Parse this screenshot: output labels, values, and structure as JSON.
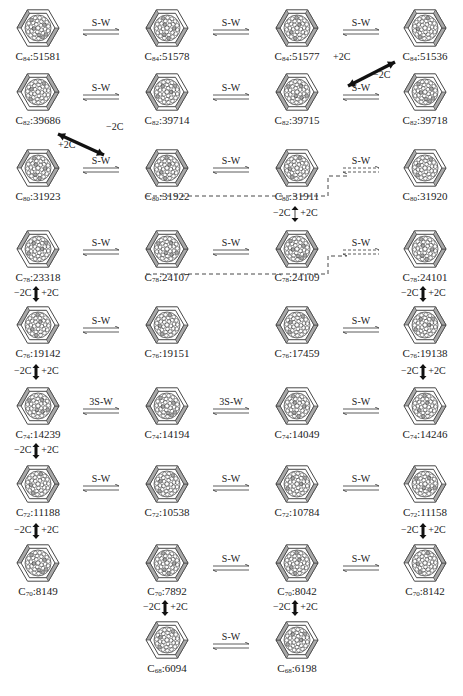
{
  "colors": {
    "line": "#333333",
    "shade": "#a8a8a8",
    "arrow": "#111111"
  },
  "columns_x": [
    38,
    167,
    297,
    425
  ],
  "nodes": [
    {
      "id": "c84-51581",
      "n": "84",
      "num": "51581",
      "col": 0,
      "y": 8
    },
    {
      "id": "c84-51578",
      "n": "84",
      "num": "51578",
      "col": 1,
      "y": 8
    },
    {
      "id": "c84-51577",
      "n": "84",
      "num": "51577",
      "col": 2,
      "y": 8
    },
    {
      "id": "c84-51536",
      "n": "84",
      "num": "51536",
      "col": 3,
      "y": 8
    },
    {
      "id": "c82-39686",
      "n": "82",
      "num": "39686",
      "col": 0,
      "y": 72
    },
    {
      "id": "c82-39714",
      "n": "82",
      "num": "39714",
      "col": 1,
      "y": 72
    },
    {
      "id": "c82-39715",
      "n": "82",
      "num": "39715",
      "col": 2,
      "y": 72
    },
    {
      "id": "c82-39718",
      "n": "82",
      "num": "39718",
      "col": 3,
      "y": 72
    },
    {
      "id": "c80-31923",
      "n": "80",
      "num": "31923",
      "col": 0,
      "y": 148
    },
    {
      "id": "c80-31922",
      "n": "80",
      "num": "31922",
      "col": 1,
      "y": 148
    },
    {
      "id": "c80-31911",
      "n": "80",
      "num": "31911",
      "col": 2,
      "y": 148
    },
    {
      "id": "c80-31920",
      "n": "80",
      "num": "31920",
      "col": 3,
      "y": 148
    },
    {
      "id": "c78-23318",
      "n": "78",
      "num": "23318",
      "col": 0,
      "y": 229
    },
    {
      "id": "c78-24107",
      "n": "78",
      "num": "24107",
      "col": 1,
      "y": 229
    },
    {
      "id": "c78-24109",
      "n": "78",
      "num": "24109",
      "col": 2,
      "y": 229
    },
    {
      "id": "c78-24101",
      "n": "78",
      "num": "24101",
      "col": 3,
      "y": 229
    },
    {
      "id": "c76-19142",
      "n": "76",
      "num": "19142",
      "col": 0,
      "y": 305
    },
    {
      "id": "c76-19151",
      "n": "76",
      "num": "19151",
      "col": 1,
      "y": 305
    },
    {
      "id": "c76-17459",
      "n": "76",
      "num": "17459",
      "col": 2,
      "y": 305
    },
    {
      "id": "c76-19138",
      "n": "76",
      "num": "19138",
      "col": 3,
      "y": 305
    },
    {
      "id": "c74-14239",
      "n": "74",
      "num": "14239",
      "col": 0,
      "y": 386
    },
    {
      "id": "c74-14194",
      "n": "74",
      "num": "14194",
      "col": 1,
      "y": 386
    },
    {
      "id": "c74-14049",
      "n": "74",
      "num": "14049",
      "col": 2,
      "y": 386
    },
    {
      "id": "c74-14246",
      "n": "74",
      "num": "14246",
      "col": 3,
      "y": 386
    },
    {
      "id": "c72-11188",
      "n": "72",
      "num": "11188",
      "col": 0,
      "y": 464
    },
    {
      "id": "c72-10538",
      "n": "72",
      "num": "10538",
      "col": 1,
      "y": 464
    },
    {
      "id": "c72-10784",
      "n": "72",
      "num": "10784",
      "col": 2,
      "y": 464
    },
    {
      "id": "c72-11158",
      "n": "72",
      "num": "11158",
      "col": 3,
      "y": 464
    },
    {
      "id": "c70-8149",
      "n": "70",
      "num": "8149",
      "col": 0,
      "y": 543
    },
    {
      "id": "c70-7892",
      "n": "70",
      "num": "7892",
      "col": 1,
      "y": 543
    },
    {
      "id": "c70-8042",
      "n": "70",
      "num": "8042",
      "col": 2,
      "y": 543
    },
    {
      "id": "c70-8142",
      "n": "70",
      "num": "8142",
      "col": 3,
      "y": 543
    },
    {
      "id": "c68-6094",
      "n": "68",
      "num": "6094",
      "col": 1,
      "y": 620
    },
    {
      "id": "c68-6198",
      "n": "68",
      "num": "6198",
      "col": 2,
      "y": 620
    }
  ],
  "sw_links": [
    {
      "label": "S-W",
      "x": 71,
      "y": 17,
      "dashed": false
    },
    {
      "label": "S-W",
      "x": 201,
      "y": 17,
      "dashed": false
    },
    {
      "label": "S-W",
      "x": 331,
      "y": 17,
      "dashed": false
    },
    {
      "label": "S-W",
      "x": 71,
      "y": 82,
      "dashed": false
    },
    {
      "label": "S-W",
      "x": 201,
      "y": 82,
      "dashed": false
    },
    {
      "label": "S-W",
      "x": 331,
      "y": 82,
      "dashed": false
    },
    {
      "label": "S-W",
      "x": 71,
      "y": 155,
      "dashed": false
    },
    {
      "label": "S-W",
      "x": 201,
      "y": 155,
      "dashed": false
    },
    {
      "label": "S-W",
      "x": 331,
      "y": 155,
      "dashed": true
    },
    {
      "label": "S-W",
      "x": 71,
      "y": 237,
      "dashed": false
    },
    {
      "label": "S-W",
      "x": 201,
      "y": 237,
      "dashed": false
    },
    {
      "label": "S-W",
      "x": 331,
      "y": 237,
      "dashed": true
    },
    {
      "label": "S-W",
      "x": 71,
      "y": 315,
      "dashed": false
    },
    {
      "label": "S-W",
      "x": 331,
      "y": 315,
      "dashed": false
    },
    {
      "label": "3S-W",
      "x": 71,
      "y": 396,
      "dashed": false
    },
    {
      "label": "3S-W",
      "x": 201,
      "y": 396,
      "dashed": false
    },
    {
      "label": "S-W",
      "x": 331,
      "y": 396,
      "dashed": false
    },
    {
      "label": "S-W",
      "x": 71,
      "y": 473,
      "dashed": false
    },
    {
      "label": "S-W",
      "x": 201,
      "y": 473,
      "dashed": false
    },
    {
      "label": "S-W",
      "x": 331,
      "y": 473,
      "dashed": false
    },
    {
      "label": "S-W",
      "x": 201,
      "y": 553,
      "dashed": false
    },
    {
      "label": "S-W",
      "x": 331,
      "y": 553,
      "dashed": false
    },
    {
      "label": "S-W",
      "x": 201,
      "y": 631,
      "dashed": false
    }
  ],
  "vertical_links": [
    {
      "x": 38,
      "y": 292,
      "minus": "−2C",
      "plus": "+2C",
      "style": "bold"
    },
    {
      "x": 425,
      "y": 292,
      "minus": "−2C",
      "plus": "+2C",
      "style": "bold"
    },
    {
      "x": 38,
      "y": 370,
      "minus": "−2C",
      "plus": "+2C",
      "style": "bold"
    },
    {
      "x": 425,
      "y": 370,
      "minus": "−2C",
      "plus": "+2C",
      "style": "bold"
    },
    {
      "x": 38,
      "y": 449,
      "minus": "−2C",
      "plus": "+2C",
      "style": "bold"
    },
    {
      "x": 38,
      "y": 529,
      "minus": "−2C",
      "plus": "+2C",
      "style": "bold"
    },
    {
      "x": 425,
      "y": 529,
      "minus": "−2C",
      "plus": "+2C",
      "style": "bold"
    },
    {
      "x": 167,
      "y": 606,
      "minus": "−2C",
      "plus": "+2C",
      "style": "bold"
    },
    {
      "x": 297,
      "y": 606,
      "minus": "−2C",
      "plus": "+2C",
      "style": "bold"
    },
    {
      "x": 297,
      "y": 212,
      "minus": "−2C",
      "plus": "+2C",
      "style": "thin"
    }
  ],
  "diagonal_links": [
    {
      "x1": 395,
      "y1": 62,
      "x2": 348,
      "y2": 86,
      "minus": "−2C",
      "plus": "+2C",
      "minus_pos": [
        373,
        78
      ],
      "plus_pos": [
        333,
        60
      ]
    },
    {
      "x1": 58,
      "y1": 134,
      "x2": 104,
      "y2": 155,
      "minus": "−2C",
      "plus": "+2C",
      "minus_pos": [
        106,
        130
      ],
      "plus_pos": [
        58,
        148
      ]
    }
  ]
}
